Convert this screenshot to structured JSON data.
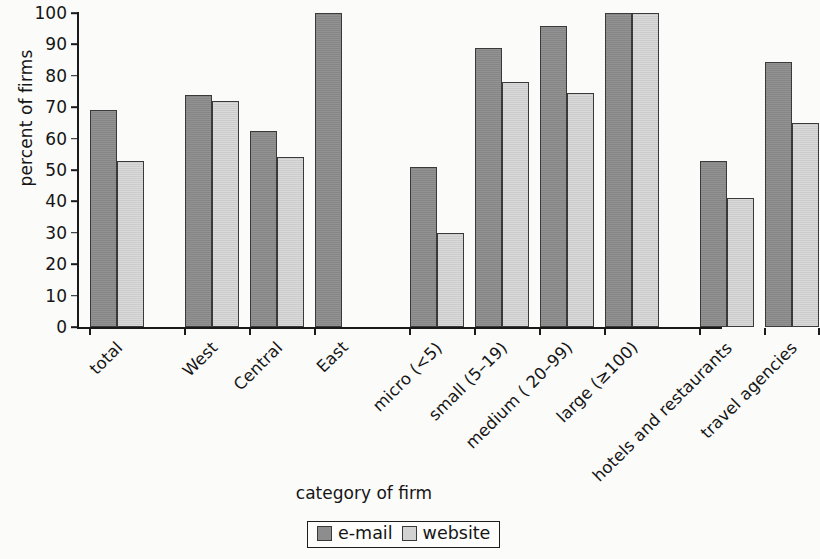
{
  "chart_data": {
    "type": "bar",
    "title": "",
    "xlabel": "category of firm",
    "ylabel": "percent of firms",
    "ylim": [
      0,
      100
    ],
    "ytick_step": 10,
    "yticks": [
      0,
      10,
      20,
      30,
      40,
      50,
      60,
      70,
      80,
      90,
      100
    ],
    "grid": false,
    "legend_position": "bottom-center",
    "categories": [
      "total",
      "West",
      "Central",
      "East",
      "micro (<5)",
      "small (5–19)",
      "medium ( 20–99)",
      "large (≥100)",
      "hotels and restaurants",
      "travel agencies"
    ],
    "series": [
      {
        "name": "e-mail",
        "color": "#8d8d8d",
        "values": [
          69,
          74,
          62.5,
          100,
          51,
          89,
          96,
          100,
          53,
          84.5
        ]
      },
      {
        "name": "website",
        "color": "#d2d2d2",
        "values": [
          53,
          72,
          54,
          null,
          30,
          78,
          74.5,
          100,
          41,
          65
        ]
      }
    ],
    "group_gaps_after": [
      "total",
      "East",
      "large (≥100)"
    ]
  },
  "legend": {
    "items": [
      {
        "label": "e-mail",
        "swatch": "dark-gray-square"
      },
      {
        "label": "website",
        "swatch": "light-gray-square"
      }
    ]
  },
  "colors": {
    "email": "#8d8d8d",
    "website": "#d2d2d2",
    "axis": "#1a1a1a",
    "background": "#fbfbf9",
    "bar_border": "#3a3a3a"
  }
}
